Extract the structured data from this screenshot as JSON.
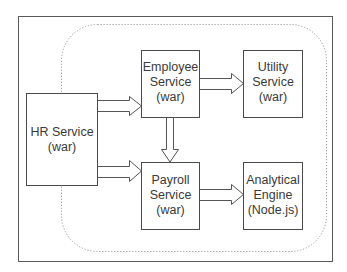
{
  "diagram": {
    "type": "architecture",
    "frame": {
      "stroke": "#555555"
    },
    "boundary": {
      "style": "dotted",
      "stroke": "#9a9a9a"
    },
    "nodes": [
      {
        "id": "hr",
        "lines": [
          "HR Service",
          "(war)"
        ]
      },
      {
        "id": "employee",
        "lines": [
          "Employee",
          "Service",
          "(war)"
        ]
      },
      {
        "id": "utility",
        "lines": [
          "Utility",
          "Service",
          "(war)"
        ]
      },
      {
        "id": "payroll",
        "lines": [
          "Payroll",
          "Service",
          "(war)"
        ]
      },
      {
        "id": "analytical",
        "lines": [
          "Analytical",
          "Engine",
          "(Node.js)"
        ]
      }
    ],
    "edges": [
      {
        "from": "hr",
        "to": "employee",
        "style": "hollow-block-arrow"
      },
      {
        "from": "hr",
        "to": "payroll",
        "style": "hollow-block-arrow"
      },
      {
        "from": "employee",
        "to": "utility",
        "style": "hollow-block-arrow"
      },
      {
        "from": "employee",
        "to": "payroll",
        "style": "hollow-block-arrow"
      },
      {
        "from": "payroll",
        "to": "analytical",
        "style": "hollow-block-arrow"
      }
    ],
    "colors": {
      "box_stroke": "#4a4a4a",
      "text": "#3a3a3a",
      "arrow_stroke": "#555555",
      "dotted": "#9a9a9a"
    }
  }
}
